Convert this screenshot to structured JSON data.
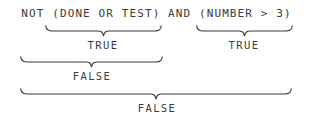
{
  "figure": {
    "type": "boolean-expression-evaluation-diagram",
    "background_color": "#ffffff",
    "ink_color": "#3b3b3b",
    "expression": "NOT (DONE OR TEST) AND (NUMBER > 3)",
    "annotations": [
      {
        "id": "group-1",
        "covers": "(DONE OR TEST)",
        "label": "TRUE",
        "brace": {
          "x1": 45,
          "x2": 162,
          "top": 25,
          "height": 11,
          "label_center_x": 103,
          "label_y": 39
        }
      },
      {
        "id": "group-2",
        "covers": "(NUMBER > 3)",
        "label": "TRUE",
        "brace": {
          "x1": 196,
          "x2": 293,
          "top": 25,
          "height": 11,
          "label_center_x": 244,
          "label_y": 39
        }
      },
      {
        "id": "group-3",
        "covers": "NOT (DONE OR TEST)",
        "label": "FALSE",
        "brace": {
          "x1": 20,
          "x2": 163,
          "top": 56,
          "height": 11,
          "label_center_x": 92,
          "label_y": 70
        }
      },
      {
        "id": "group-4",
        "covers": "NOT (DONE OR TEST) AND (NUMBER > 3)",
        "label": "FALSE",
        "brace": {
          "x1": 20,
          "x2": 292,
          "top": 88,
          "height": 11,
          "label_center_x": 157,
          "label_y": 102
        }
      }
    ]
  }
}
